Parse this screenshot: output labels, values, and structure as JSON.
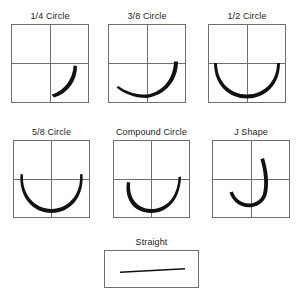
{
  "figure": {
    "background_color": "#ffffff",
    "line_color": "#6f6f6f",
    "needle_color": "#111111",
    "label_color": "#1c1c1c"
  },
  "panels": [
    {
      "id": "quarter-circle",
      "label": "1/4 Circle",
      "row": 1,
      "column": 1,
      "box": {
        "x": 11,
        "y": 24,
        "width": 78,
        "height": 79
      },
      "grid": {
        "vertical": true,
        "horizontal": true
      },
      "shape": {
        "type": "arc",
        "description": "shallow quarter arc in lower right quadrant, rising to the right",
        "arc_fraction": "1/4"
      }
    },
    {
      "id": "three-eighths-circle",
      "label": "3/8 Circle",
      "row": 1,
      "column": 2,
      "box": {
        "x": 108,
        "y": 24,
        "width": 78,
        "height": 79
      },
      "grid": {
        "vertical": true,
        "horizontal": true
      },
      "shape": {
        "type": "arc",
        "description": "three-eighths arc sweeping from lower left across the bottom and up the right",
        "arc_fraction": "3/8"
      }
    },
    {
      "id": "half-circle",
      "label": "1/2 Circle",
      "row": 1,
      "column": 3,
      "box": {
        "x": 208,
        "y": 24,
        "width": 78,
        "height": 79
      },
      "grid": {
        "vertical": true,
        "horizontal": true
      },
      "shape": {
        "type": "arc",
        "description": "semicircular arc spanning the lower half, endpoints on the horizontal midline",
        "arc_fraction": "1/2"
      }
    },
    {
      "id": "five-eighths-circle",
      "label": "5/8 Circle",
      "row": 2,
      "column": 1,
      "box": {
        "x": 13,
        "y": 140,
        "width": 77,
        "height": 78
      },
      "grid": {
        "vertical": true,
        "horizontal": true
      },
      "shape": {
        "type": "arc",
        "description": "five-eighths arc, a deep U whose tips curl slightly above the horizontal midline",
        "arc_fraction": "5/8"
      }
    },
    {
      "id": "compound-circle",
      "label": "Compound Circle",
      "row": 2,
      "column": 2,
      "box": {
        "x": 113,
        "y": 140,
        "width": 77,
        "height": 78
      },
      "grid": {
        "vertical": true,
        "horizontal": true
      },
      "shape": {
        "type": "compound-arc",
        "description": "asymmetric U of two blended radii, tighter on the left, sweeping higher on the right",
        "arc_fraction": "compound"
      }
    },
    {
      "id": "j-shape",
      "label": "J Shape",
      "row": 2,
      "column": 3,
      "box": {
        "x": 212,
        "y": 140,
        "width": 78,
        "height": 78
      },
      "grid": {
        "vertical": true,
        "horizontal": true
      },
      "shape": {
        "type": "j-hook",
        "description": "J hook descending from upper right quadrant, curving around the bottom and rising to the left",
        "arc_fraction": "J"
      }
    },
    {
      "id": "straight",
      "label": "Straight",
      "row": 3,
      "column": 2,
      "box": {
        "x": 104,
        "y": 250,
        "width": 95,
        "height": 38
      },
      "grid": {
        "vertical": false,
        "horizontal": false
      },
      "shape": {
        "type": "straight",
        "description": "straight tapered needle lying horizontally across the box",
        "arc_fraction": "0"
      }
    }
  ]
}
